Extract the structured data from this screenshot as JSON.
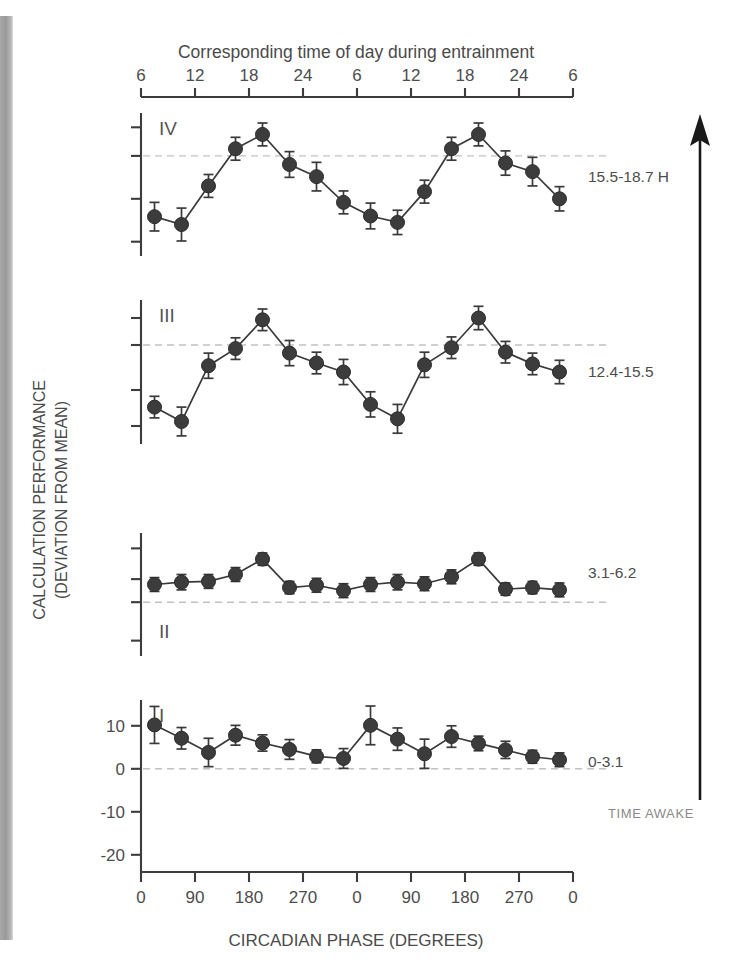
{
  "figure": {
    "top_axis_title": "Corresponding time of day during entrainment",
    "bottom_axis_title": "CIRCADIAN PHASE (DEGREES)",
    "ylabel_line1": "CALCULATION PERFORMANCE",
    "ylabel_line2": "(DEVIATION FROM MEAN)",
    "time_awake_label": "TIME AWAKE",
    "marker_color": "#3c3c3c",
    "line_color": "#3a3a3a",
    "zero_line_color": "#c2c2c2",
    "axis_color": "#3c3c3c",
    "text_color": "#4a4a4a",
    "arrow_color": "#1a1a1a"
  },
  "chart_data": {
    "type": "line",
    "title": "Corresponding time of day during entrainment",
    "xlabel": "CIRCADIAN PHASE (DEGREES)",
    "ylabel": "CALCULATION PERFORMANCE (DEVIATION FROM MEAN)",
    "grid": false,
    "legend_position": "right",
    "x_top_ticks": [
      "6",
      "12",
      "18",
      "24",
      "6",
      "12",
      "18",
      "24",
      "6"
    ],
    "x_top_title": "Corresponding time of day during entrainment",
    "x_bottom_ticks": [
      "0",
      "90",
      "180",
      "270",
      "0",
      "90",
      "180",
      "270",
      "0"
    ],
    "x_values_degrees": [
      11.25,
      33.75,
      56.25,
      78.75,
      101.25,
      123.75,
      146.25,
      168.75,
      191.25,
      213.75,
      236.25,
      258.75,
      281.25,
      303.75,
      326.25,
      348.75
    ],
    "xlim": [
      0,
      720
    ],
    "panels": [
      {
        "roman": "IV",
        "side_label": "15.5-18.7 H",
        "time_awake_range": "15.5-18.7 H",
        "values": [
          -8.5,
          -9.6,
          -4.2,
          1.0,
          3.0,
          -1.2,
          -2.9,
          -6.5,
          -8.4,
          -9.3,
          -5.0,
          1.0,
          3.0,
          -1.0,
          -2.2,
          -6.0
        ],
        "errors": [
          2.0,
          2.3,
          1.6,
          1.6,
          1.6,
          1.8,
          2.0,
          1.6,
          1.8,
          1.7,
          1.6,
          1.6,
          1.6,
          1.7,
          2.0,
          1.7
        ],
        "ylim": [
          -14,
          6
        ],
        "yticks": [
          -12,
          -6,
          0,
          4
        ],
        "zero_level": 0
      },
      {
        "roman": "III",
        "side_label": "12.4-15.5",
        "time_awake_range": "12.4-15.5",
        "values": [
          -6.9,
          -8.5,
          -2.3,
          -0.4,
          2.8,
          -0.9,
          -2.0,
          -3.0,
          -6.6,
          -8.2,
          -2.2,
          -0.3,
          3.0,
          -0.8,
          -2.1,
          -3.0
        ],
        "errors": [
          1.2,
          1.6,
          1.4,
          1.2,
          1.2,
          1.4,
          1.2,
          1.4,
          1.4,
          1.6,
          1.4,
          1.2,
          1.3,
          1.2,
          1.2,
          1.3
        ],
        "ylim": [
          -11,
          5
        ],
        "yticks": [
          -9,
          -5,
          0,
          3
        ],
        "zero_level": 0
      },
      {
        "roman": "II",
        "side_label": "3.1-6.2",
        "time_awake_range": "3.1-6.2",
        "values": [
          2.3,
          2.6,
          2.7,
          3.6,
          5.6,
          1.9,
          2.2,
          1.5,
          2.3,
          2.6,
          2.4,
          3.3,
          5.6,
          1.7,
          1.9,
          1.6
        ],
        "errors": [
          0.9,
          1.0,
          0.9,
          0.9,
          0.8,
          0.8,
          0.9,
          0.9,
          0.9,
          1.0,
          0.9,
          0.9,
          0.8,
          0.8,
          0.8,
          0.9
        ],
        "ylim": [
          -7,
          9
        ],
        "yticks": [
          7,
          3,
          0,
          -5
        ],
        "zero_level": 0
      },
      {
        "roman": "I",
        "side_label": "0-3.1",
        "time_awake_range": "0-3.1",
        "values": [
          10.2,
          7.1,
          3.8,
          7.8,
          6.0,
          4.5,
          2.9,
          2.4,
          10.1,
          6.9,
          3.5,
          7.5,
          5.9,
          4.4,
          2.8,
          2.1
        ],
        "errors": [
          4.3,
          2.5,
          3.3,
          2.3,
          1.9,
          2.3,
          1.5,
          2.3,
          4.5,
          2.6,
          3.4,
          2.5,
          1.7,
          2.0,
          1.5,
          1.6
        ],
        "ylim": [
          -24,
          16
        ],
        "yticks": [
          10,
          0,
          -10,
          -20
        ],
        "ytick_labels": [
          "10",
          "0",
          "-10",
          "-20"
        ],
        "zero_level": 0
      }
    ]
  }
}
